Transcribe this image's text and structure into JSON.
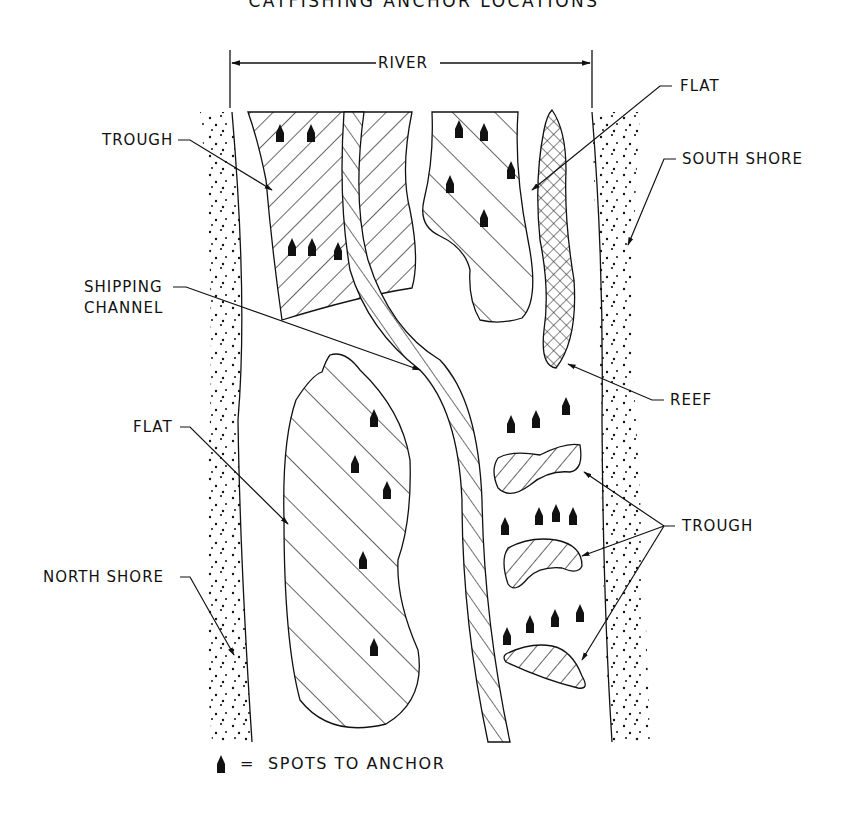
{
  "title": "CATFISHING ANCHOR LOCATIONS",
  "dimension": {
    "label": "RIVER"
  },
  "labels": {
    "trough_top": "TROUGH",
    "shipping_channel_line1": "SHIPPING",
    "shipping_channel_line2": "CHANNEL",
    "flat_left": "FLAT",
    "north_shore": "NORTH SHORE",
    "flat_right": "FLAT",
    "south_shore": "SOUTH SHORE",
    "reef": "REEF",
    "trough_right": "TROUGH"
  },
  "legend": {
    "symbol": "anchor-spot-marker",
    "text": "=  SPOTS TO ANCHOR"
  },
  "features": [
    {
      "type": "shore",
      "name": "North Shore",
      "pattern": "stipple"
    },
    {
      "type": "shore",
      "name": "South Shore",
      "pattern": "stipple"
    },
    {
      "type": "trough",
      "name": "Upper-left trough",
      "pattern": "dense-hatch",
      "anchor_spots": 5
    },
    {
      "type": "channel",
      "name": "Shipping Channel",
      "pattern": "ladder-hatch"
    },
    {
      "type": "flat",
      "name": "Upper-right flat",
      "pattern": "hatch",
      "anchor_spots": 4
    },
    {
      "type": "reef",
      "name": "Reef",
      "pattern": "crosshatch"
    },
    {
      "type": "flat",
      "name": "Lower-left flat",
      "pattern": "hatch",
      "anchor_spots": 5
    },
    {
      "type": "trough",
      "name": "Right troughs",
      "count": 3,
      "pattern": "hatch",
      "anchor_spots": 11
    }
  ],
  "colors": {
    "ink": "#111111",
    "background": "#ffffff"
  }
}
